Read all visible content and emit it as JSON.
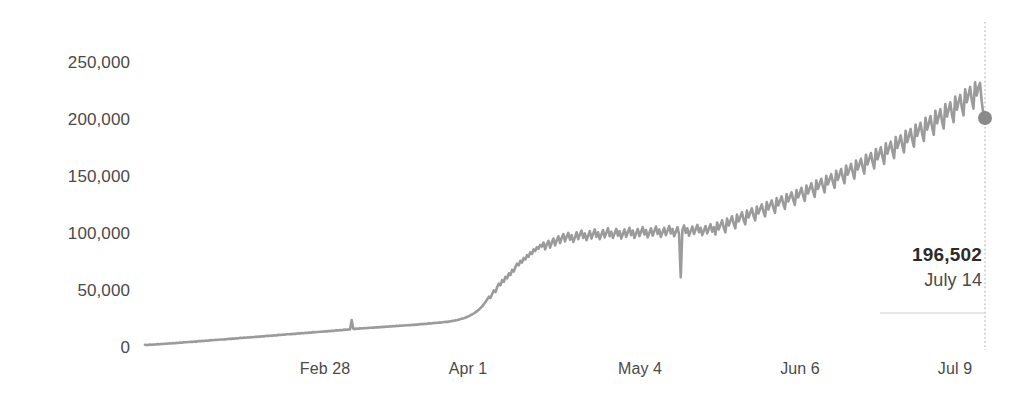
{
  "chart_data": {
    "type": "line",
    "title": "",
    "subtitle": "",
    "xlabel": "",
    "ylabel": "",
    "ylim": [
      0,
      262000
    ],
    "grid": false,
    "legend": false,
    "line_color": "#9b9b9b",
    "marker_color": "#8a8a8a",
    "y_ticks": [
      {
        "value": 250000,
        "label": "250,000",
        "y_px": 63
      },
      {
        "value": 200000,
        "label": "200,000",
        "y_px": 120
      },
      {
        "value": 150000,
        "label": "150,000",
        "y_px": 177
      },
      {
        "value": 100000,
        "label": "100,000",
        "y_px": 234
      },
      {
        "value": 50000,
        "label": "50,000",
        "y_px": 291
      },
      {
        "value": 0,
        "label": "0",
        "y_px": 348
      }
    ],
    "x_ticks": [
      {
        "label": "Feb 28",
        "x_px": 325
      },
      {
        "label": "Apr 1",
        "x_px": 468
      },
      {
        "label": "May 4",
        "x_px": 640
      },
      {
        "label": "Jun 6",
        "x_px": 800
      },
      {
        "label": "Jul 9",
        "x_px": 955
      }
    ],
    "x_start_px": 145,
    "x_end_px": 985,
    "values": [
      2800,
      2600,
      2700,
      3000,
      2900,
      3100,
      3000,
      3200,
      3400,
      3300,
      3600,
      3500,
      3800,
      3700,
      3900,
      4100,
      4000,
      4300,
      4200,
      4500,
      4400,
      4700,
      4600,
      4900,
      5100,
      5000,
      5300,
      5200,
      5500,
      5400,
      5700,
      5600,
      5900,
      6100,
      6000,
      6300,
      6200,
      6500,
      6400,
      6700,
      6900,
      6800,
      7100,
      7000,
      7300,
      7200,
      7500,
      7400,
      7700,
      7600,
      7900,
      8100,
      8000,
      8300,
      8200,
      8500,
      8400,
      8700,
      8900,
      8800,
      9100,
      9000,
      9300,
      9200,
      9500,
      9400,
      9700,
      9900,
      9800,
      10100,
      10000,
      10300,
      10200,
      10500,
      10700,
      10600,
      10900,
      10800,
      11100,
      11000,
      11300,
      11500,
      11400,
      11700,
      11600,
      11900,
      12100,
      12000,
      12300,
      12200,
      12500,
      12400,
      12700,
      12900,
      12800,
      13100,
      13000,
      13300,
      13200,
      13500,
      13400,
      13700,
      13900,
      13800,
      14100,
      14000,
      14300,
      14200,
      14500,
      14700,
      14600,
      14900,
      14800,
      15100,
      15000,
      15300,
      15500,
      15400,
      15700,
      15600,
      15900,
      16100,
      16000,
      16300,
      16200,
      24500,
      16800,
      16600,
      17000,
      16900,
      17200,
      17100,
      17400,
      17300,
      17600,
      17500,
      17800,
      17700,
      18000,
      17900,
      18200,
      18100,
      18400,
      18300,
      18600,
      18500,
      18800,
      18700,
      19000,
      18900,
      19200,
      19100,
      19400,
      19300,
      19600,
      19500,
      19800,
      19700,
      20000,
      19900,
      20200,
      20100,
      20400,
      20300,
      20600,
      20500,
      20800,
      21000,
      20900,
      21200,
      21100,
      21400,
      21600,
      21500,
      21800,
      22000,
      21900,
      22200,
      22400,
      22300,
      22600,
      22800,
      23000,
      22900,
      23200,
      23500,
      23800,
      24000,
      24300,
      24600,
      25000,
      25400,
      25800,
      26200,
      26800,
      27400,
      28000,
      28800,
      29600,
      30500,
      31500,
      32600,
      33800,
      35200,
      36800,
      38500,
      40500,
      42800,
      45000,
      44000,
      47500,
      50500,
      49000,
      53500,
      56500,
      55000,
      59500,
      58000,
      62500,
      61000,
      65500,
      64000,
      68500,
      67000,
      71000,
      74000,
      72500,
      76500,
      75000,
      79000,
      77500,
      81500,
      80000,
      84000,
      82500,
      86500,
      85000,
      88500,
      87000,
      90500,
      89000,
      92500,
      86500,
      91000,
      94000,
      88000,
      92500,
      96000,
      90000,
      94500,
      98000,
      92000,
      96500,
      100000,
      93500,
      97500,
      101000,
      95000,
      99000,
      93000,
      97000,
      101500,
      95500,
      99500,
      103000,
      96500,
      100500,
      94500,
      98500,
      102500,
      96000,
      100000,
      104000,
      97500,
      101500,
      95500,
      99500,
      103500,
      97000,
      101000,
      105000,
      98000,
      102000,
      96500,
      100500,
      104500,
      98500,
      102500,
      96000,
      100000,
      104000,
      97500,
      101500,
      105500,
      99000,
      103000,
      96500,
      100500,
      104500,
      98000,
      102000,
      106000,
      99500,
      103500,
      97000,
      101000,
      105000,
      98500,
      102500,
      106500,
      100000,
      104000,
      97500,
      101500,
      105500,
      99000,
      103000,
      107000,
      100500,
      104500,
      98000,
      102000,
      106000,
      99500,
      62000,
      103500,
      107500,
      101000,
      105000,
      98500,
      102500,
      106500,
      100000,
      104000,
      108000,
      101500,
      105500,
      99000,
      103000,
      107000,
      100500,
      104500,
      108500,
      102000,
      106000,
      99500,
      110000,
      104000,
      108000,
      112000,
      105500,
      101500,
      113500,
      107500,
      111500,
      115500,
      109000,
      105000,
      117000,
      111000,
      115000,
      119000,
      112500,
      108500,
      120500,
      114500,
      118500,
      122500,
      116000,
      112000,
      124000,
      118000,
      122000,
      126000,
      119500,
      115500,
      128000,
      121500,
      125500,
      129500,
      123000,
      118500,
      131500,
      125000,
      129000,
      133000,
      126500,
      122000,
      135000,
      128500,
      132500,
      136500,
      130000,
      125500,
      138500,
      132000,
      136000,
      140500,
      133500,
      129000,
      142500,
      135500,
      140000,
      144500,
      137500,
      132500,
      147000,
      139500,
      144000,
      148500,
      141500,
      136500,
      151000,
      143500,
      148000,
      152500,
      145500,
      140500,
      155500,
      147500,
      152000,
      157000,
      149500,
      144500,
      160000,
      152000,
      156500,
      161500,
      154000,
      148500,
      164500,
      156500,
      161000,
      166000,
      158500,
      153000,
      169500,
      161000,
      166000,
      171000,
      163000,
      157500,
      174500,
      165500,
      170500,
      176000,
      167500,
      161500,
      179500,
      170500,
      175500,
      181000,
      172500,
      166500,
      185000,
      175500,
      180500,
      186500,
      177500,
      171500,
      190500,
      180500,
      186000,
      192000,
      182500,
      176500,
      196000,
      186000,
      191500,
      197500,
      188000,
      181500,
      202000,
      191500,
      197000,
      203500,
      193500,
      187000,
      208000,
      197000,
      203000,
      209500,
      199000,
      192500,
      214000,
      203000,
      209000,
      215500,
      205000,
      198000,
      220500,
      209000,
      215500,
      222000,
      211000,
      204000,
      227000,
      215500,
      222000,
      229000,
      217500,
      210000,
      233000,
      221500,
      228500,
      232500,
      216500,
      205000,
      196502
    ]
  },
  "annotation": {
    "value_label": "196,502",
    "date_label": "July 14",
    "marker_value": 196502,
    "marker_x_px": 985,
    "marker_y_px": 118,
    "guide_line_top_px": 22,
    "guide_line_bottom_px": 350,
    "separator_y_px": 313,
    "separator_x_start_px": 880,
    "separator_x_end_px": 985
  }
}
